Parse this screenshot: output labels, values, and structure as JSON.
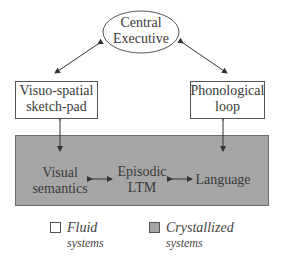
{
  "diagram": {
    "central": {
      "line1": "Central",
      "line2": "Executive"
    },
    "left_box": {
      "line1": "Visuo-spatial",
      "line2": "sketch-pad"
    },
    "right_box": {
      "line1": "Phonological",
      "line2": "loop"
    },
    "ltm": {
      "visual": {
        "line1": "Visual",
        "line2": "semantics"
      },
      "episodic": {
        "line1": "Episodic",
        "line2": "LTM"
      },
      "language": {
        "line1": "Language"
      }
    },
    "legend": {
      "fluid": {
        "line1": "Fluid",
        "line2": "systems",
        "color": "#ffffff"
      },
      "crystallized": {
        "line1": "Crystallized",
        "line2": "systems",
        "color": "#a6a6a6"
      }
    }
  }
}
